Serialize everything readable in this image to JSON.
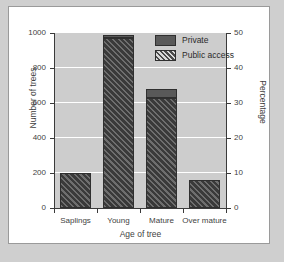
{
  "chart_data": {
    "type": "bar",
    "title": "",
    "xlabel": "Age of tree",
    "ylabel": "Number of trees",
    "ylabel_right": "Percentage",
    "categories": [
      "Saplings",
      "Young",
      "Mature",
      "Over mature"
    ],
    "ylim": [
      0,
      1000
    ],
    "yticks": [
      0,
      200,
      400,
      600,
      800,
      1000
    ],
    "ylim_right": [
      0,
      50
    ],
    "yticks_right": [
      0,
      10,
      20,
      30,
      40,
      50
    ],
    "grid": true,
    "legend_position": "top-right",
    "stacked": true,
    "series": [
      {
        "name": "Public access",
        "values": [
          200,
          970,
          630,
          160
        ]
      },
      {
        "name": "Private",
        "values": [
          0,
          20,
          50,
          0
        ]
      }
    ],
    "totals": [
      200,
      990,
      680,
      160
    ],
    "totals_percentage": [
      10,
      49.5,
      34,
      8
    ]
  },
  "legend": {
    "items": [
      {
        "label": "Private",
        "pattern": "solid",
        "color": "#595959"
      },
      {
        "label": "Public access",
        "pattern": "diagonal-hatch",
        "color": "#4a4a4a"
      }
    ]
  },
  "axes": {
    "left": {
      "label": "Number of trees",
      "ticks": [
        "0",
        "200",
        "400",
        "600",
        "800",
        "1000"
      ]
    },
    "right": {
      "label": "Percentage",
      "ticks": [
        "0",
        "10",
        "20",
        "30",
        "40",
        "50"
      ]
    },
    "bottom": {
      "label": "Age of tree",
      "ticks": [
        "Saplings",
        "Young",
        "Mature",
        "Over mature"
      ]
    }
  },
  "colors": {
    "plot_background": "#cdcdcd",
    "gridline": "#ffffff",
    "card_background": "#ffffff",
    "page_background": "#cfcfcf",
    "axis": "#3a3a3a",
    "private": "#595959",
    "public": "#4a4a4a"
  }
}
